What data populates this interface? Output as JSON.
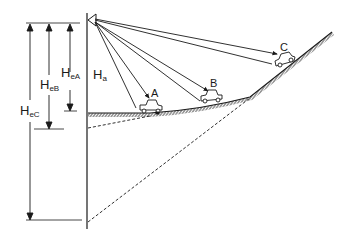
{
  "diagram": {
    "colors": {
      "ink": "#1a1a1a",
      "background": "#ffffff"
    },
    "labels": {
      "Ha": {
        "main": "H",
        "sub": "a"
      },
      "HeA": {
        "main": "H",
        "sub": "eA"
      },
      "HeB": {
        "main": "H",
        "sub": "eB"
      },
      "HeC": {
        "main": "H",
        "sub": "eC"
      },
      "A": "A",
      "B": "B",
      "C": "C"
    },
    "elements": {
      "light_source": "luminaire-icon",
      "pole": "vertical-pole",
      "ground": "hatched-road-profile",
      "vehicles": [
        "A",
        "B",
        "C"
      ],
      "dimension_arrows": [
        "HeA",
        "HeB",
        "HeC"
      ],
      "projection_lines": [
        "dashed-extension-flat",
        "dashed-extension-slope"
      ]
    }
  }
}
